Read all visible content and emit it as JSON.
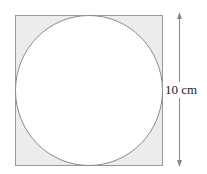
{
  "diagram": {
    "dimension_label": "10 cm",
    "colors": {
      "square_fill": "#ececec",
      "square_stroke": "#999999",
      "circle_fill": "#ffffff",
      "circle_stroke": "#8a8a8a",
      "arrow": "#888888"
    }
  }
}
